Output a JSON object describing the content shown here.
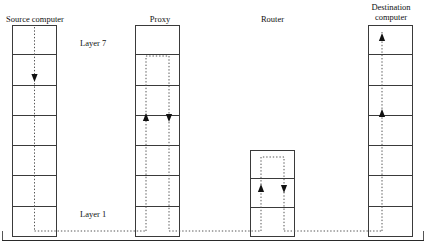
{
  "diagram": {
    "title_nodes": [
      {
        "id": "source",
        "label": "Source computer",
        "x": 0,
        "y": 14,
        "width": 70,
        "layers": 7
      },
      {
        "id": "proxy",
        "label": "Proxy",
        "x": 140,
        "y": 14,
        "width": 40,
        "layers": 7
      },
      {
        "id": "router",
        "label": "Router",
        "x": 250,
        "y": 14,
        "width": 45,
        "layers": 3
      },
      {
        "id": "destination",
        "label": "Destination\ncomputer",
        "x": 358,
        "y": 2,
        "width": 66,
        "layers": 7
      }
    ],
    "layer_labels": [
      {
        "id": "layer-top",
        "text": "Layer 7",
        "x": 80,
        "y": 38
      },
      {
        "id": "layer-bottom",
        "text": "Layer 1",
        "x": 80,
        "y": 209
      }
    ],
    "stacks": [
      {
        "id": "source-computer-stack",
        "name": "Source computer",
        "x": 12,
        "y": 25,
        "width": 45,
        "height": 212,
        "layers": 7,
        "flow": "down"
      },
      {
        "id": "proxy-stack",
        "name": "Proxy",
        "x": 135,
        "y": 25,
        "width": 45,
        "height": 212,
        "layers": 7,
        "flow": "up-down"
      },
      {
        "id": "router-stack",
        "name": "Router",
        "x": 250,
        "y": 150,
        "width": 45,
        "height": 87,
        "layers": 3,
        "flow": "up-down"
      },
      {
        "id": "destination-computer-stack",
        "name": "Destination computer",
        "x": 368,
        "y": 25,
        "width": 45,
        "height": 212,
        "layers": 7,
        "flow": "up"
      }
    ],
    "colors": {
      "stroke": "#3a3a3a",
      "path": "#555555",
      "arrow": "#111111",
      "text": "#111111",
      "baseline": "#2a2a2a"
    },
    "paths": {
      "description": "Dotted data path traversing the protocol stacks",
      "baseline_y": 231,
      "frame_bottom_y": 240,
      "frame_left_x": 2,
      "frame_right_x": 424
    },
    "arrows": [
      {
        "id": "source-down-arrow",
        "x": 34.5,
        "y": 78,
        "dir": "down"
      },
      {
        "id": "proxy-up-arrow",
        "x": 146,
        "y": 118,
        "dir": "up"
      },
      {
        "id": "proxy-down-arrow",
        "x": 169,
        "y": 118,
        "dir": "down"
      },
      {
        "id": "router-up-arrow",
        "x": 261,
        "y": 189,
        "dir": "up"
      },
      {
        "id": "router-down-arrow",
        "x": 284,
        "y": 189,
        "dir": "down"
      },
      {
        "id": "destination-mid-arrow",
        "x": 382,
        "y": 114,
        "dir": "up"
      },
      {
        "id": "destination-top-arrow",
        "x": 382,
        "y": 38,
        "dir": "up"
      }
    ]
  }
}
